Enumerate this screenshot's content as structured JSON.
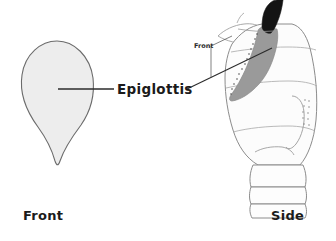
{
  "figure": {
    "type": "anatomical-illustration",
    "subject": "Epiglottis",
    "background_color": "#ffffff",
    "views": [
      {
        "id": "front",
        "caption": "Front",
        "description": "leaf-shaped epiglottis cartilage viewed from the front"
      },
      {
        "id": "side",
        "caption": "Side",
        "description": "sagittal view of the larynx with the epiglottis highlighted"
      }
    ]
  },
  "labels": {
    "main": "Epiglottis",
    "front_bottom": "Front",
    "side_bottom": "Side",
    "front_inset": "Front"
  },
  "colors": {
    "outline": "#6b6b6b",
    "leaf_fill": "#ededed",
    "epiglottis_tip": "#141414",
    "epiglottis_band": "#9a9a9a",
    "larynx_fill": "#fcfcfc",
    "larynx_outline": "#8c8c8c",
    "leader_line": "#2b2b2b",
    "text": "#1b1b1b"
  }
}
